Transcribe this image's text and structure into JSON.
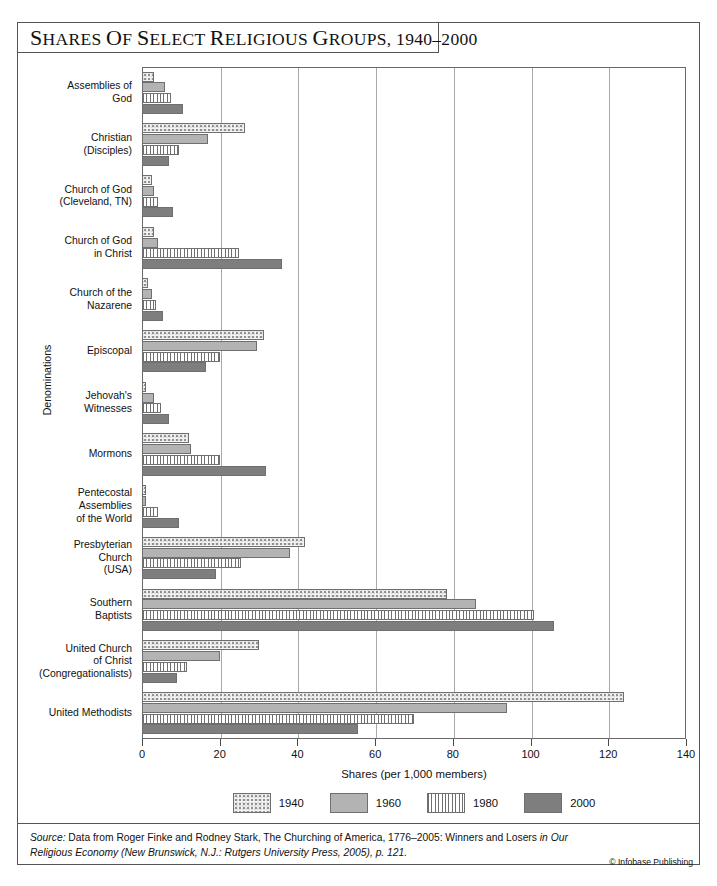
{
  "title": "SHARES OF SELECT RELIGIOUS GROUPS, 1940–2000",
  "axis": {
    "y_title": "Denominations",
    "x_title": "Shares (per 1,000 members)",
    "x_ticks": [
      "0",
      "20",
      "40",
      "60",
      "80",
      "100",
      "120",
      "140"
    ]
  },
  "legend": [
    {
      "label": "1940",
      "key": "sw-1940"
    },
    {
      "label": "1960",
      "key": "sw-1960"
    },
    {
      "label": "1980",
      "key": "sw-1980"
    },
    {
      "label": "2000",
      "key": "sw-2000"
    }
  ],
  "source": {
    "line1_lead": "Source:",
    "line1": " Data from Roger Finke and Rodney Stark, The Churching of America, 1776–2005: Winners and Losers",
    "line2": "in Our Religious Economy (New Brunswick, N.J.: Rutgers University Press, 2005), p. 121.",
    "credit": "© Infobase Publishing"
  },
  "colors": {
    "series_1940": "#f3f3f3",
    "series_1960": "#b3b3b3",
    "series_1980": "#ffffff",
    "series_2000": "#7e7e7e",
    "border": "#6f6f6f",
    "grid": "#a9a9a9"
  },
  "chart_data": {
    "type": "bar",
    "orientation": "horizontal",
    "title": "Shares of Select Religious Groups, 1940–2000",
    "xlabel": "Shares (per 1,000 members)",
    "ylabel": "Denominations",
    "xlim": [
      0,
      140
    ],
    "xticks": [
      0,
      20,
      40,
      60,
      80,
      100,
      120,
      140
    ],
    "grid": "vertical",
    "legend_position": "bottom",
    "categories": [
      "Assemblies of God",
      "Christian (Disciples)",
      "Church of God (Cleveland, TN)",
      "Church of God in Christ",
      "Church of the Nazarene",
      "Episcopal",
      "Jehovah's Witnesses",
      "Mormons",
      "Pentecostal Assemblies of the World",
      "Presbyterian Church (USA)",
      "Southern Baptists",
      "United Church of Christ (Congregationalists)",
      "United Methodists"
    ],
    "category_lines": [
      [
        "Assemblies of",
        "God"
      ],
      [
        "Christian",
        "(Disciples)"
      ],
      [
        "Church of God",
        "(Cleveland, TN)"
      ],
      [
        "Church of God",
        "in Christ"
      ],
      [
        "Church of the",
        "Nazarene"
      ],
      [
        "Episcopal"
      ],
      [
        "Jehovah's",
        "Witnesses"
      ],
      [
        "Mormons"
      ],
      [
        "Pentecostal",
        "Assemblies",
        "of the World"
      ],
      [
        "Presbyterian",
        "Church",
        "(USA)"
      ],
      [
        "Southern",
        "Baptists"
      ],
      [
        "United Church",
        "of Christ",
        "(Congregationalists)"
      ],
      [
        "United Methodists"
      ]
    ],
    "series": [
      {
        "name": "1940",
        "values": [
          3,
          26.5,
          2.5,
          3,
          1.5,
          31.5,
          1,
          12,
          1,
          42,
          78.5,
          30,
          124
        ]
      },
      {
        "name": "1960",
        "values": [
          6,
          17,
          3,
          4,
          2.5,
          29.5,
          3,
          12.5,
          1,
          38,
          86,
          20,
          94
        ]
      },
      {
        "name": "1980",
        "values": [
          7.5,
          9.5,
          4,
          25,
          3.5,
          20,
          5,
          20,
          4,
          25.5,
          101,
          11.5,
          70
        ]
      },
      {
        "name": "2000",
        "values": [
          10.5,
          7,
          8,
          36,
          5.5,
          16.5,
          7,
          32,
          9.5,
          19,
          106,
          9,
          55.5
        ]
      }
    ]
  }
}
